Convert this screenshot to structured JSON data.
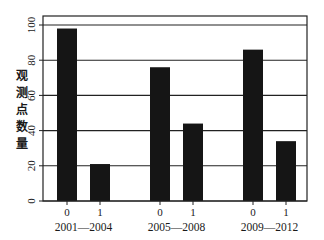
{
  "chart_data": {
    "type": "bar",
    "title": "",
    "xlabel": "",
    "ylabel": "观测点数量",
    "ylim": [
      0,
      100
    ],
    "yticks": [
      0,
      20,
      40,
      60,
      80,
      100
    ],
    "grid": true,
    "legend": null,
    "groups": [
      {
        "label": "2001—2004",
        "categories": [
          "0",
          "1"
        ],
        "values": [
          98,
          21
        ]
      },
      {
        "label": "2005—2008",
        "categories": [
          "0",
          "1"
        ],
        "values": [
          76,
          44
        ]
      },
      {
        "label": "2009—2012",
        "categories": [
          "0",
          "1"
        ],
        "values": [
          86,
          34
        ]
      }
    ],
    "colors": {
      "bar": "#151515",
      "grid": "#222222",
      "frame": "#222222"
    }
  }
}
